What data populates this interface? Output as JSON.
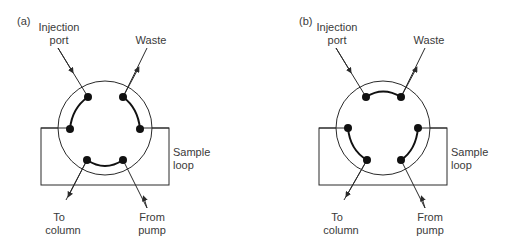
{
  "panels": [
    {
      "id": "a",
      "tag": "(a)",
      "labels": {
        "injection_1": "Injection",
        "injection_2": "port",
        "waste": "Waste",
        "sample_1": "Sample",
        "sample_2": "loop",
        "to_1": "To",
        "to_2": "column",
        "from_1": "From",
        "from_2": "pump"
      },
      "state": "load"
    },
    {
      "id": "b",
      "tag": "(b)",
      "labels": {
        "injection_1": "Injection",
        "injection_2": "port",
        "waste": "Waste",
        "sample_1": "Sample",
        "sample_2": "loop",
        "to_1": "To",
        "to_2": "column",
        "from_1": "From",
        "from_2": "pump"
      },
      "state": "inject"
    }
  ],
  "colors": {
    "line": "#2a2a2a",
    "text": "#3a3a3a",
    "dot": "#111111"
  }
}
